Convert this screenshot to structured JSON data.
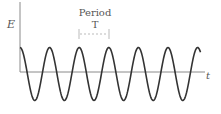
{
  "diagram": {
    "y_axis_label": "E",
    "x_axis_label": "t",
    "period_label": "Period",
    "period_symbol": "T",
    "wave": {
      "type": "cosine",
      "cycles_shown": 6.1,
      "start_phase": "peak",
      "color": "#333333"
    },
    "axis_color": "#888888",
    "bracket_color": "#aaaaaa"
  }
}
